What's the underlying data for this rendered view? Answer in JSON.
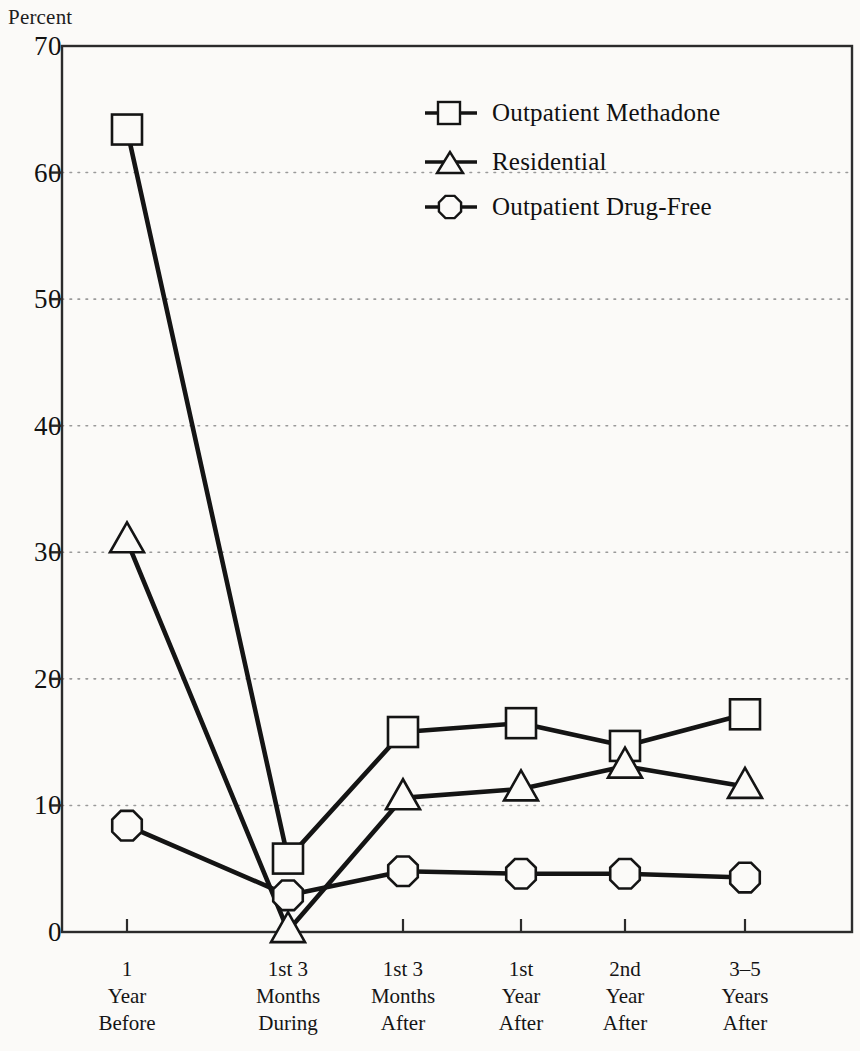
{
  "chart_data": {
    "type": "line",
    "title": "",
    "ylabel": "Percent",
    "xlabel": "",
    "ylim": [
      0,
      70
    ],
    "yticks": [
      0,
      10,
      20,
      30,
      40,
      50,
      60,
      70
    ],
    "ytick_labels": [
      "0",
      "10",
      "20",
      "30",
      "40",
      "50",
      "60",
      "70"
    ],
    "grid": "horizontal-dotted",
    "legend_position": "top-right-inside",
    "categories": [
      {
        "line1": "1",
        "line2": "Year",
        "line3": "Before"
      },
      {
        "line1": "1st 3",
        "line2": "Months",
        "line3": "During"
      },
      {
        "line1": "1st 3",
        "line2": "Months",
        "line3": "After"
      },
      {
        "line1": "1st",
        "line2": "Year",
        "line3": "After"
      },
      {
        "line1": "2nd",
        "line2": "Year",
        "line3": "After"
      },
      {
        "line1": "3–5",
        "line2": "Years",
        "line3": "After"
      }
    ],
    "series": [
      {
        "name": "Outpatient Methadone",
        "marker": "square",
        "color": "#141414",
        "values": [
          63.4,
          5.8,
          15.8,
          16.5,
          14.7,
          17.2
        ]
      },
      {
        "name": "Residential",
        "marker": "triangle",
        "color": "#141414",
        "values": [
          30.9,
          0.1,
          10.6,
          11.3,
          13.1,
          11.5
        ]
      },
      {
        "name": "Outpatient Drug-Free",
        "marker": "hexagon",
        "color": "#141414",
        "values": [
          8.4,
          2.9,
          4.8,
          4.6,
          4.6,
          4.3
        ]
      }
    ]
  },
  "legend": {
    "items": [
      {
        "label": "Outpatient Methadone",
        "marker": "square"
      },
      {
        "label": "Residential",
        "marker": "triangle"
      },
      {
        "label": "Outpatient Drug-Free",
        "marker": "hexagon"
      }
    ]
  },
  "colors": {
    "background": "#fbfaf8",
    "ink": "#141414",
    "grid": "#9a9a9a",
    "frame": "#2b2b2b"
  }
}
